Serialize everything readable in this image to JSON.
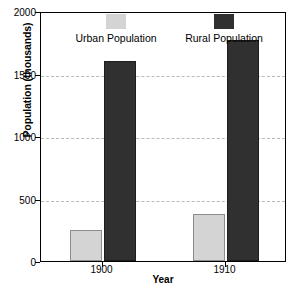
{
  "chart_data": {
    "type": "bar",
    "title": "",
    "xlabel": "Year",
    "ylabel": "Population (thousands)",
    "categories": [
      "1900",
      "1910"
    ],
    "series": [
      {
        "name": "Urban Population",
        "values": [
          250,
          380
        ],
        "color": "#d4d4d4"
      },
      {
        "name": "Rural Population",
        "values": [
          1600,
          1770
        ],
        "color": "#303030"
      }
    ],
    "ylim": [
      0,
      2000
    ],
    "yticks": [
      0,
      500,
      1000,
      1500,
      2000
    ],
    "ytick_labels": [
      "0",
      "500",
      "1000",
      "1500",
      "2000"
    ],
    "grid": true,
    "grid_axis": "y",
    "grid_style": "dashed",
    "grid_color": "#b9b9b9",
    "legend_position": "top-inside",
    "frame_color": "#000000",
    "background": "#ffffff"
  }
}
